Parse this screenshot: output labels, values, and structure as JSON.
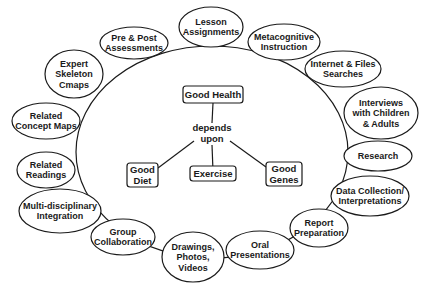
{
  "diagram": {
    "big_ellipse": {
      "cx": 212,
      "cy": 152,
      "rx": 136,
      "ry": 106
    },
    "concept_map": {
      "root": {
        "label": "Good Health",
        "x": 183,
        "y": 86,
        "w": 60,
        "h": 17
      },
      "linking_phrase": {
        "lines": [
          "depends",
          "upon"
        ],
        "x": 212,
        "y": 133
      },
      "children": [
        {
          "lines": [
            "Good",
            "Diet"
          ],
          "x": 127,
          "y": 163,
          "w": 31,
          "h": 24
        },
        {
          "lines": [
            "Exercise"
          ],
          "x": 190,
          "y": 166,
          "w": 46,
          "h": 15
        },
        {
          "lines": [
            "Good",
            "Genes"
          ],
          "x": 266,
          "y": 162,
          "w": 36,
          "h": 24
        }
      ]
    },
    "outer_nodes": [
      {
        "id": "pre-post-assessments",
        "lines": [
          "Pre & Post",
          "Assessments"
        ],
        "cx": 134,
        "cy": 43,
        "rx": 34,
        "ry": 16
      },
      {
        "id": "lesson-assignments",
        "lines": [
          "Lesson",
          "Assignments"
        ],
        "cx": 211,
        "cy": 27,
        "rx": 32,
        "ry": 20
      },
      {
        "id": "metacognitive-instruction",
        "lines": [
          "Metacognitive",
          "Instruction"
        ],
        "cx": 284,
        "cy": 42,
        "rx": 36,
        "ry": 18
      },
      {
        "id": "internet-files-searches",
        "lines": [
          "Internet & Files",
          "Searches"
        ],
        "cx": 343,
        "cy": 69,
        "rx": 38,
        "ry": 18
      },
      {
        "id": "expert-skeleton-cmaps",
        "lines": [
          "Expert",
          "Skeleton",
          "Cmaps"
        ],
        "cx": 74,
        "cy": 74,
        "rx": 29,
        "ry": 24
      },
      {
        "id": "related-concept-maps",
        "lines": [
          "Related",
          "Concept Maps"
        ],
        "cx": 46,
        "cy": 121,
        "rx": 34,
        "ry": 18
      },
      {
        "id": "interviews",
        "lines": [
          "Interviews",
          "with Children",
          "& Adults"
        ],
        "cx": 381,
        "cy": 113,
        "rx": 37,
        "ry": 26
      },
      {
        "id": "research",
        "lines": [
          "Research"
        ],
        "cx": 378,
        "cy": 156,
        "rx": 34,
        "ry": 15
      },
      {
        "id": "related-readings",
        "lines": [
          "Related",
          "Readings"
        ],
        "cx": 46,
        "cy": 170,
        "rx": 29,
        "ry": 18
      },
      {
        "id": "data-collection",
        "lines": [
          "Data Collection/",
          "Interpretations"
        ],
        "cx": 370,
        "cy": 196,
        "rx": 39,
        "ry": 20
      },
      {
        "id": "multi-disciplinary-integration",
        "lines": [
          "Multi-disciplinary",
          "Integration"
        ],
        "cx": 60,
        "cy": 211,
        "rx": 41,
        "ry": 22
      },
      {
        "id": "group-collaboration",
        "lines": [
          "Group",
          "Collaboration"
        ],
        "cx": 123,
        "cy": 237,
        "rx": 32,
        "ry": 18
      },
      {
        "id": "report-preparation",
        "lines": [
          "Report",
          "Preparation"
        ],
        "cx": 319,
        "cy": 228,
        "rx": 29,
        "ry": 19
      },
      {
        "id": "drawings-photos-videos",
        "lines": [
          "Drawings,",
          "Photos,",
          "Videos"
        ],
        "cx": 193,
        "cy": 257,
        "rx": 31,
        "ry": 25
      },
      {
        "id": "oral-presentations",
        "lines": [
          "Oral",
          "Presentations"
        ],
        "cx": 260,
        "cy": 250,
        "rx": 34,
        "ry": 19
      }
    ]
  }
}
